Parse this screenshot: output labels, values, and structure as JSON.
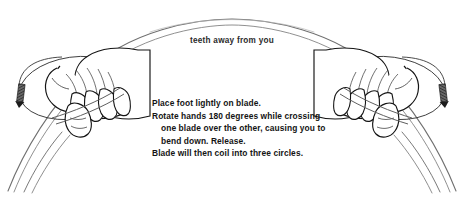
{
  "diagram": {
    "title_caption": "teeth away from you",
    "instruction_lines": [
      {
        "text": "Place foot lightly on blade.",
        "indent": false
      },
      {
        "text": "Rotate hands 180 degrees while crossing",
        "indent": false
      },
      {
        "text": "one blade over the other, causing you to",
        "indent": true
      },
      {
        "text": "bend down. Release.",
        "indent": true
      },
      {
        "text": "Blade will then coil into three circles.",
        "indent": false
      }
    ],
    "elements": {
      "blade_label": "saw-blade-arc",
      "left_hand_label": "left-hand-grip",
      "right_hand_label": "right-hand-grip",
      "left_rotation_label": "left-rotation-indicator",
      "right_rotation_label": "right-rotation-indicator"
    },
    "colors": {
      "background": "#ffffff",
      "blade_line": "#7d7d7d",
      "hand_outline": "#1a1a1a",
      "arrow_fill": "#4a4a4a",
      "text": "#141414"
    }
  }
}
